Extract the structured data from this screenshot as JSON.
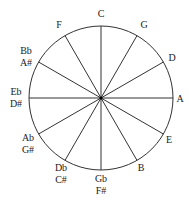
{
  "diagram": {
    "center": [
      101,
      98
    ],
    "radius": 72,
    "stroke_color": "#333333",
    "notes": [
      {
        "angle": 0,
        "lines": [
          "C"
        ],
        "pos": [
          101,
          14
        ]
      },
      {
        "angle": 30,
        "lines": [
          "G"
        ],
        "pos": [
          144,
          25
        ]
      },
      {
        "angle": 60,
        "lines": [
          "D"
        ],
        "pos": [
          172,
          58
        ]
      },
      {
        "angle": 90,
        "lines": [
          "A"
        ],
        "pos": [
          180,
          99
        ]
      },
      {
        "angle": 120,
        "lines": [
          "E"
        ],
        "pos": [
          169,
          140
        ]
      },
      {
        "angle": 150,
        "lines": [
          "B"
        ],
        "pos": [
          141,
          168
        ]
      },
      {
        "angle": 180,
        "lines": [
          "Gb",
          "F#"
        ],
        "pos": [
          101,
          185
        ]
      },
      {
        "angle": 210,
        "lines": [
          "Db",
          "C#"
        ],
        "pos": [
          61,
          174
        ]
      },
      {
        "angle": 240,
        "lines": [
          "Ab",
          "G#"
        ],
        "pos": [
          28,
          144
        ]
      },
      {
        "angle": 270,
        "lines": [
          "Eb",
          "D#"
        ],
        "pos": [
          16,
          98
        ]
      },
      {
        "angle": 300,
        "lines": [
          "Bb",
          "A#"
        ],
        "pos": [
          26,
          57
        ]
      },
      {
        "angle": 330,
        "lines": [
          "F"
        ],
        "pos": [
          59,
          25
        ]
      }
    ]
  }
}
